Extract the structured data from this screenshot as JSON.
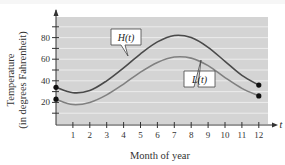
{
  "chart_data": {
    "type": "line",
    "title": "",
    "xlabel": "Month of year",
    "ylabel_lines": [
      "Temperature",
      "(in degrees Fahrenheit)"
    ],
    "x_axis_var": "t",
    "x_ticks": [
      1,
      2,
      3,
      4,
      5,
      6,
      7,
      8,
      9,
      10,
      11,
      12
    ],
    "y_ticks": [
      20,
      40,
      60,
      80
    ],
    "xlim": [
      0,
      12.6
    ],
    "ylim": [
      0,
      95
    ],
    "grid": true,
    "grid_step": 10,
    "series": [
      {
        "name": "H(t)",
        "label": "H(t)",
        "color": "#4a4a4a",
        "x": [
          0,
          1,
          2,
          3,
          4,
          5,
          6,
          7,
          8,
          9,
          10,
          11,
          12
        ],
        "values": [
          34,
          29,
          31,
          40,
          52,
          65,
          76,
          82,
          80,
          71,
          58,
          45,
          36
        ]
      },
      {
        "name": "L(t)",
        "label": "L(t)",
        "color": "#808080",
        "x": [
          0,
          1,
          2,
          3,
          4,
          5,
          6,
          7,
          8,
          9,
          10,
          11,
          12
        ],
        "values": [
          23,
          18,
          20,
          27,
          37,
          48,
          57,
          62,
          61,
          54,
          43,
          33,
          26
        ]
      }
    ],
    "endpoint_markers": true
  },
  "colors": {
    "plot_bg": "#d4d4d4",
    "grid": "#ececec",
    "axis": "#333333"
  }
}
